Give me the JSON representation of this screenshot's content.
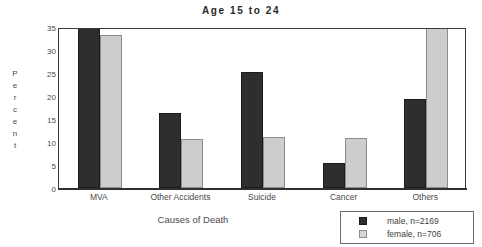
{
  "chart_data": {
    "type": "bar",
    "title": "Age 15 to 24",
    "xlabel": "Causes of Death",
    "ylabel": "Percent",
    "ylim": [
      0,
      35
    ],
    "yticks": [
      0,
      5,
      10,
      15,
      20,
      25,
      30,
      35
    ],
    "grid": false,
    "legend_position": "bottom-right",
    "categories": [
      "MVA",
      "Other Accidents",
      "Suicide",
      "Cancer",
      "Others"
    ],
    "series": [
      {
        "name": "male, n=2169",
        "color": "#2e2e2e",
        "values": [
          35.0,
          16.3,
          25.2,
          5.5,
          19.4
        ]
      },
      {
        "name": "female, n=706",
        "color": "#cdcdcd",
        "values": [
          33.2,
          10.7,
          11.1,
          10.9,
          35.0
        ]
      }
    ]
  },
  "axis": {
    "ylabel_letters": [
      "P",
      "e",
      "r",
      "c",
      "e",
      "n",
      "t"
    ]
  },
  "legend": {
    "entries": [
      {
        "label": "male, n=2169",
        "swatch": "male-swatch"
      },
      {
        "label": "female, n=706",
        "swatch": "female-swatch"
      }
    ]
  }
}
